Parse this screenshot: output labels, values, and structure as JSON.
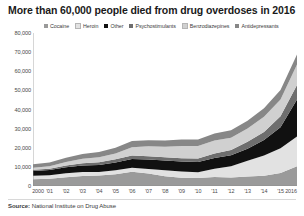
{
  "title": "More than 60,000 people died from drug overdoses in 2016",
  "source": {
    "prefix": "Source:",
    "text": "National Institute on Drug Abuse"
  },
  "colors": {
    "cocaine": "#9a9a9a",
    "heroin": "#e2e2e2",
    "other": "#111111",
    "psychostimulants": "#6e6e6e",
    "benzodiazepines": "#d0d0d0",
    "antidepressants": "#878787",
    "axis": "#8a8a8a",
    "text": "#3a3a3a"
  },
  "chart_data": {
    "type": "area",
    "stacked": true,
    "title": "More than 60,000 people died from drug overdoses in 2016",
    "xlabel": "",
    "ylabel": "",
    "ylim": [
      0,
      80000
    ],
    "ytick_values": [
      0,
      10000,
      20000,
      30000,
      40000,
      50000,
      60000,
      70000,
      80000
    ],
    "ytick_labels": [
      "0",
      "10,000",
      "20,000",
      "30,000",
      "40,000",
      "50,000",
      "60,000",
      "70,000",
      "80,000"
    ],
    "grid": false,
    "legend_position": "top",
    "x": [
      2000,
      2001,
      2002,
      2003,
      2004,
      2005,
      2006,
      2007,
      2008,
      2009,
      2010,
      2011,
      2012,
      2013,
      2014,
      2015,
      2016
    ],
    "xtick_labels": [
      "2000",
      "'01",
      "'02",
      "'03",
      "'04",
      "'05",
      "'06",
      "'07",
      "'08",
      "'09",
      "'10",
      "'11",
      "'12",
      "'13",
      "'14",
      "'15",
      "2016"
    ],
    "series": [
      {
        "name": "Cocaine",
        "color": "#9a9a9a",
        "values": [
          3544,
          3833,
          4599,
          5196,
          5443,
          6208,
          7448,
          6512,
          5129,
          4350,
          4183,
          4681,
          4404,
          4944,
          5415,
          6784,
          10375
        ]
      },
      {
        "name": "Heroin",
        "color": "#e2e2e2",
        "values": [
          1842,
          1779,
          2089,
          2080,
          1878,
          2009,
          2088,
          2399,
          3041,
          3278,
          3036,
          4397,
          5925,
          8257,
          10574,
          12989,
          15469
        ]
      },
      {
        "name": "Other",
        "color": "#111111",
        "values": [
          2500,
          2700,
          3100,
          3400,
          3700,
          4100,
          4600,
          4900,
          5100,
          5200,
          5300,
          5600,
          5800,
          6300,
          8000,
          11000,
          19413
        ]
      },
      {
        "name": "Psychostimulants",
        "color": "#6e6e6e",
        "values": [
          547,
          708,
          921,
          1178,
          1371,
          1608,
          1756,
          1756,
          1715,
          1632,
          1854,
          2266,
          2635,
          3627,
          4298,
          5716,
          7542
        ]
      },
      {
        "name": "Benzodiazepines",
        "color": "#d0d0d0",
        "values": [
          1135,
          1298,
          1802,
          2350,
          2663,
          3116,
          4434,
          5187,
          5568,
          6497,
          6497,
          6872,
          6524,
          6973,
          7945,
          8791,
          10684
        ]
      },
      {
        "name": "Antidepressants",
        "color": "#878787",
        "values": [
          1749,
          1935,
          2207,
          2514,
          2733,
          3004,
          3164,
          3201,
          3247,
          3346,
          3499,
          3656,
          3797,
          4074,
          4451,
          4883,
          5269
        ]
      }
    ]
  }
}
